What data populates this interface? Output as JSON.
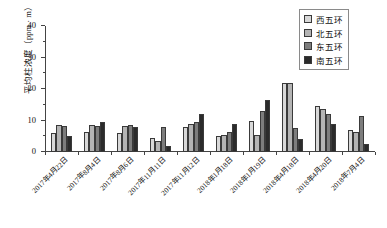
{
  "chart_data": {
    "type": "bar",
    "title": "",
    "xlabel": "",
    "ylabel": "平均柱浓度（ppm · m）",
    "ylim": [
      0,
      40
    ],
    "ytick_labels": [
      "0",
      "10",
      "20",
      "30",
      "40"
    ],
    "ytick_values": [
      0,
      10,
      20,
      30,
      40
    ],
    "yminor_step": 5,
    "grid": false,
    "legend_position": "top-right",
    "categories": [
      "2017年4月22日",
      "2017年8月4日",
      "2017年8月6日",
      "2017年11月11日",
      "2017年11月12日",
      "2018年1月18日",
      "2018年1月19日",
      "2018年4月18日",
      "2018年4月20日",
      "2018年7月4日"
    ],
    "series": [
      {
        "name": "西五环",
        "color": "#d8d8d8",
        "values": [
          6.0,
          6.3,
          6.0,
          4.5,
          8.0,
          5.0,
          10.0,
          22.0,
          14.5,
          7.0
        ]
      },
      {
        "name": "北五环",
        "color": "#b4b4b4",
        "values": [
          8.5,
          8.5,
          8.3,
          3.5,
          9.0,
          5.3,
          5.5,
          22.0,
          13.8,
          6.5
        ]
      },
      {
        "name": "东五环",
        "color": "#7d7d7d",
        "values": [
          8.2,
          8.3,
          8.5,
          8.0,
          9.5,
          6.5,
          13.0,
          7.5,
          12.0,
          11.5
        ]
      },
      {
        "name": "南五环",
        "color": "#2b2b2b",
        "values": [
          5.0,
          9.5,
          8.0,
          2.0,
          12.0,
          9.0,
          16.5,
          4.0,
          9.0,
          2.5
        ]
      }
    ]
  }
}
